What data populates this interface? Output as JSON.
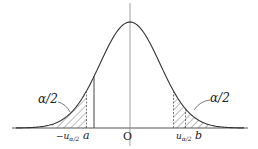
{
  "diagram": {
    "type": "normal-distribution-curve",
    "curve": {
      "mean": 0,
      "sd": 1,
      "x_range": [
        -3.8,
        3.8
      ]
    },
    "markers": {
      "neg_u": -1.45,
      "a": -1.2,
      "u": 1.45,
      "b": 1.85
    },
    "labels": {
      "left_tail": "α/2",
      "right_tail": "α/2",
      "neg_u_main": "−u",
      "neg_u_sub": "α/2",
      "a": "a",
      "origin": "O",
      "u_main": "u",
      "u_sub": "α/2",
      "b": "b"
    },
    "colors": {
      "curve": "#333333",
      "axis": "#555555",
      "hatch": "#444444"
    }
  }
}
